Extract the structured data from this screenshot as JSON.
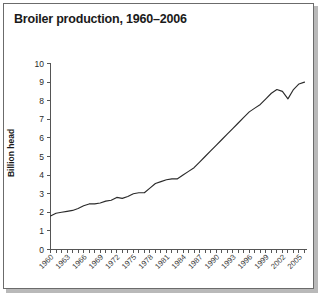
{
  "figure": {
    "title": "Broiler production, 1960–2006",
    "background": "#ffffff",
    "border_color": "#6b6b6b",
    "line_color": "#2b2b2b"
  },
  "chart_data": {
    "type": "line",
    "title": "Broiler production, 1960–2006",
    "xlabel": "",
    "ylabel": "Billion head",
    "ylim": [
      0,
      10
    ],
    "xlim": [
      1960,
      2006
    ],
    "grid": false,
    "legend": "none",
    "y_ticks": [
      "0",
      "1",
      "2",
      "3",
      "4",
      "5",
      "6",
      "7",
      "8",
      "9",
      "10"
    ],
    "x_ticks": [
      "1960",
      "1963",
      "1966",
      "1969",
      "1972",
      "1975",
      "1978",
      "1981",
      "1984",
      "1987",
      "1990",
      "1993",
      "1996",
      "1999",
      "2002",
      "2005"
    ],
    "x": [
      1960,
      1961,
      1962,
      1963,
      1964,
      1965,
      1966,
      1967,
      1968,
      1969,
      1970,
      1971,
      1972,
      1973,
      1974,
      1975,
      1976,
      1977,
      1978,
      1979,
      1980,
      1981,
      1982,
      1983,
      1984,
      1985,
      1986,
      1987,
      1988,
      1989,
      1990,
      1991,
      1992,
      1993,
      1994,
      1995,
      1996,
      1997,
      1998,
      1999,
      2000,
      2001,
      2002,
      2003,
      2004,
      2005,
      2006
    ],
    "series": [
      {
        "name": "Broiler production",
        "units": "Billion head",
        "values": [
          1.8,
          1.95,
          2.0,
          2.05,
          2.1,
          2.2,
          2.35,
          2.45,
          2.45,
          2.5,
          2.6,
          2.65,
          2.8,
          2.75,
          2.85,
          3.0,
          3.05,
          3.05,
          3.3,
          3.55,
          3.65,
          3.75,
          3.8,
          3.8,
          4.0,
          4.2,
          4.4,
          4.7,
          5.0,
          5.3,
          5.6,
          5.9,
          6.2,
          6.5,
          6.8,
          7.1,
          7.4,
          7.6,
          7.8,
          8.1,
          8.4,
          8.6,
          8.5,
          8.1,
          8.6,
          8.9,
          9.0
        ]
      }
    ]
  },
  "axes": {
    "y_axis_title": "Billion head"
  }
}
